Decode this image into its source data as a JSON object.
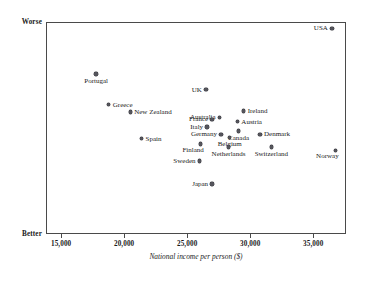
{
  "axes": {
    "y_worse_label": "Worse",
    "y_better_label": "Better",
    "y_axis_title": "Index of health and social problems",
    "x_axis_title": "National income per person ($)",
    "x_tick_labels": [
      "15,000",
      "20,000",
      "25,000",
      "30,000",
      "35,000"
    ]
  },
  "chart_data": {
    "type": "scatter",
    "title": "",
    "xlabel": "National income per person ($)",
    "ylabel": "Index of health and social problems",
    "xlim": [
      13800,
      37600
    ],
    "ylim": [
      0,
      100
    ],
    "grid": false,
    "legend": null,
    "xticks": [
      15000,
      20000,
      25000,
      30000,
      35000
    ],
    "xticklabels": [
      "15,000",
      "20,000",
      "25,000",
      "30,000",
      "35,000"
    ],
    "yticks": [
      0,
      100
    ],
    "yticklabels": [
      "Better",
      "Worse"
    ],
    "note": "y axis is an unitless index; only the endpoints Better (low) and Worse (high) are labelled",
    "points": [
      {
        "name": "USA",
        "x": 36400,
        "y": 97.5,
        "label_pos": "left"
      },
      {
        "name": "Portugal",
        "x": 17700,
        "y": 76.0,
        "label_pos": "below"
      },
      {
        "name": "UK",
        "x": 26400,
        "y": 68.5,
        "label_pos": "left"
      },
      {
        "name": "Greece",
        "x": 18700,
        "y": 61.5,
        "label_pos": "right"
      },
      {
        "name": "New Zealand",
        "x": 20400,
        "y": 58.0,
        "label_pos": "right"
      },
      {
        "name": "Ireland",
        "x": 29400,
        "y": 58.5,
        "label_pos": "right"
      },
      {
        "name": "Australia",
        "x": 27500,
        "y": 55.5,
        "label_pos": "left"
      },
      {
        "name": "France",
        "x": 26900,
        "y": 54.5,
        "label_pos": "left"
      },
      {
        "name": "Austria",
        "x": 28900,
        "y": 53.5,
        "label_pos": "right"
      },
      {
        "name": "Italy",
        "x": 26500,
        "y": 51.0,
        "label_pos": "left"
      },
      {
        "name": "Canada",
        "x": 29000,
        "y": 49.0,
        "label_pos": "below"
      },
      {
        "name": "Germany",
        "x": 27600,
        "y": 47.5,
        "label_pos": "left"
      },
      {
        "name": "Denmark",
        "x": 30700,
        "y": 47.5,
        "label_pos": "right"
      },
      {
        "name": "Belgium",
        "x": 28300,
        "y": 46.0,
        "label_pos": "below"
      },
      {
        "name": "Spain",
        "x": 21300,
        "y": 45.5,
        "label_pos": "right"
      },
      {
        "name": "Finland",
        "x": 26000,
        "y": 43.0,
        "label_pos": "below-left"
      },
      {
        "name": "Netherlands",
        "x": 28200,
        "y": 41.5,
        "label_pos": "below"
      },
      {
        "name": "Switzerland",
        "x": 31600,
        "y": 41.5,
        "label_pos": "below"
      },
      {
        "name": "Norway",
        "x": 36700,
        "y": 40.0,
        "label_pos": "below-left"
      },
      {
        "name": "Sweden",
        "x": 25900,
        "y": 35.0,
        "label_pos": "left"
      },
      {
        "name": "Japan",
        "x": 26900,
        "y": 24.0,
        "label_pos": "left"
      }
    ]
  }
}
